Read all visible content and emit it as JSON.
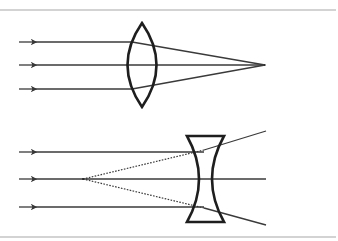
{
  "diagram": {
    "title": "",
    "colors": {
      "background": "#ffffff",
      "rule": "#a8a8a8",
      "ray": "#3a3a3a",
      "lens": "#1e1e1e",
      "virtual_ray": "#3a3a3a"
    },
    "panels": [
      {
        "name": "converging-lens",
        "lens_type": "convex",
        "incoming_rays_y": [
          42,
          65,
          89
        ],
        "focal_point": [
          265,
          65
        ]
      },
      {
        "name": "diverging-lens",
        "lens_type": "concave",
        "incoming_rays_y": [
          152,
          179,
          207
        ],
        "virtual_focal_point": [
          83,
          179
        ]
      }
    ]
  }
}
